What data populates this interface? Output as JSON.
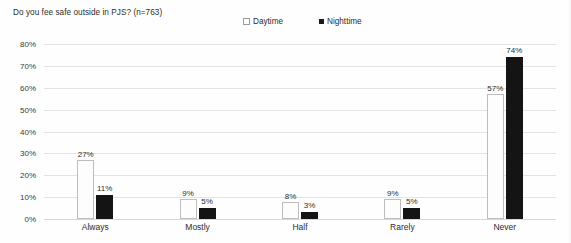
{
  "chart_data": {
    "type": "bar",
    "title": "Do you fee safe outside in PJS? (n=763)",
    "xlabel": "",
    "ylabel": "",
    "categories": [
      "Always",
      "Mostly",
      "Half",
      "Rarely",
      "Never"
    ],
    "series": [
      {
        "name": "Daytime",
        "marker": "dotted-light-square",
        "color": "#fdfdfd",
        "values": [
          27,
          9,
          8,
          9,
          57
        ],
        "labels": [
          "27%",
          "9%",
          "8%",
          "9%",
          "57%"
        ]
      },
      {
        "name": "Nighttime",
        "marker": "dotted-dark-square",
        "color": "#141414",
        "values": [
          11,
          5,
          3,
          5,
          74
        ],
        "labels": [
          "11%",
          "5%",
          "3%",
          "5%",
          "74%"
        ]
      }
    ],
    "ylim": [
      0,
      80
    ],
    "yticks": [
      0,
      10,
      20,
      30,
      40,
      50,
      60,
      70,
      80
    ],
    "ytick_labels": [
      "0%",
      "10%",
      "20%",
      "30%",
      "40%",
      "50%",
      "60%",
      "70%",
      "80%"
    ],
    "grid": true,
    "legend_position": "top-center",
    "value_labels_shown": true
  },
  "legend": {
    "entries": [
      {
        "label": "Daytime"
      },
      {
        "label": "Nighttime"
      }
    ]
  }
}
